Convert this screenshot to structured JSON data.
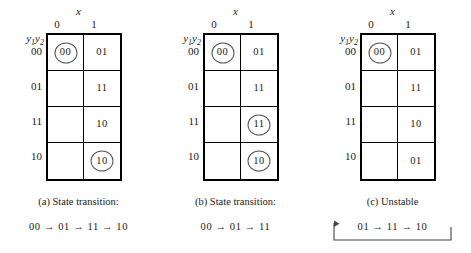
{
  "figure": {
    "panels": [
      {
        "id": "a",
        "input_var": "x",
        "state_var_html": "y1y2",
        "col_headers": [
          "0",
          "1"
        ],
        "row_headers": [
          "00",
          "01",
          "11",
          "10"
        ],
        "cells": [
          [
            {
              "text": "00",
              "circled": true
            },
            {
              "text": "01",
              "circled": false
            }
          ],
          [
            {
              "text": "",
              "circled": false
            },
            {
              "text": "11",
              "circled": false
            }
          ],
          [
            {
              "text": "",
              "circled": false
            },
            {
              "text": "10",
              "circled": false
            }
          ],
          [
            {
              "text": "",
              "circled": false
            },
            {
              "text": "10",
              "circled": true
            }
          ]
        ],
        "caption": "(a)  State transition:",
        "transition": "00 → 01 → 11 → 10",
        "has_cycle_bracket": false
      },
      {
        "id": "b",
        "input_var": "x",
        "state_var_html": "y1y2",
        "col_headers": [
          "0",
          "1"
        ],
        "row_headers": [
          "00",
          "01",
          "11",
          "10"
        ],
        "cells": [
          [
            {
              "text": "00",
              "circled": true
            },
            {
              "text": "01",
              "circled": false
            }
          ],
          [
            {
              "text": "",
              "circled": false
            },
            {
              "text": "11",
              "circled": false
            }
          ],
          [
            {
              "text": "",
              "circled": false
            },
            {
              "text": "11",
              "circled": true
            }
          ],
          [
            {
              "text": "",
              "circled": false
            },
            {
              "text": "10",
              "circled": true
            }
          ]
        ],
        "caption": "(b)  State transition:",
        "transition": "00 → 01 → 11",
        "has_cycle_bracket": false
      },
      {
        "id": "c",
        "input_var": "x",
        "state_var_html": "y1y2",
        "col_headers": [
          "0",
          "1"
        ],
        "row_headers": [
          "00",
          "01",
          "11",
          "10"
        ],
        "cells": [
          [
            {
              "text": "00",
              "circled": true
            },
            {
              "text": "01",
              "circled": false
            }
          ],
          [
            {
              "text": "",
              "circled": false
            },
            {
              "text": "11",
              "circled": false
            }
          ],
          [
            {
              "text": "",
              "circled": false
            },
            {
              "text": "10",
              "circled": false
            }
          ],
          [
            {
              "text": "",
              "circled": false
            },
            {
              "text": "01",
              "circled": false
            }
          ]
        ],
        "caption": "(c)  Unstable",
        "transition": "01 → 11 → 10",
        "has_cycle_bracket": true
      }
    ],
    "colors": {
      "ink": "#1a1a1a",
      "grid_line": "#000000",
      "circle_stroke": "#555555",
      "background": "#ffffff"
    }
  }
}
